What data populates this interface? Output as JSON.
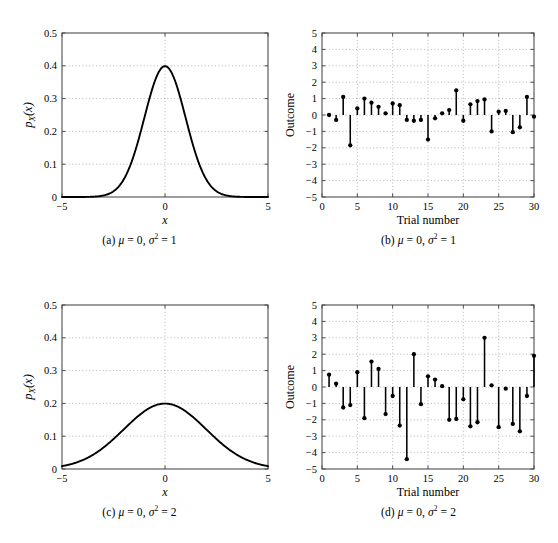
{
  "figure": {
    "background_color": "#ffffff",
    "axis_color": "#4d4d4d",
    "curve_color": "#000000",
    "grid_color": "#9a9a9a"
  },
  "panels": [
    {
      "id": "a",
      "caption_prefix": "(a)",
      "caption_mu": "μ",
      "caption_mu_value": "0",
      "caption_sigma": "σ",
      "caption_sigma_exp": "2",
      "caption_sigma_value": "1",
      "xlabel": "x",
      "ylabel": "p_X(x)",
      "ylabel_parts": {
        "p": "p",
        "sub": "X",
        "arg": "(x)"
      },
      "xticks": [
        "−5",
        "0",
        "5"
      ],
      "yticks": [
        "0",
        "0.1",
        "0.2",
        "0.3",
        "0.4",
        "0.5"
      ]
    },
    {
      "id": "b",
      "caption_prefix": "(b)",
      "caption_mu": "μ",
      "caption_mu_value": "0",
      "caption_sigma": "σ",
      "caption_sigma_exp": "2",
      "caption_sigma_value": "1",
      "xlabel": "Trial number",
      "ylabel": "Outcome",
      "xticks": [
        "0",
        "5",
        "10",
        "15",
        "20",
        "25",
        "30"
      ],
      "yticks": [
        "−5",
        "−4",
        "−3",
        "−2",
        "−1",
        "0",
        "1",
        "2",
        "3",
        "4",
        "5"
      ]
    },
    {
      "id": "c",
      "caption_prefix": "(c)",
      "caption_mu": "μ",
      "caption_mu_value": "0",
      "caption_sigma": "σ",
      "caption_sigma_exp": "2",
      "caption_sigma_value": "2",
      "xlabel": "x",
      "ylabel": "p_X(x)",
      "ylabel_parts": {
        "p": "p",
        "sub": "X",
        "arg": "(x)"
      },
      "xticks": [
        "−5",
        "0",
        "5"
      ],
      "yticks": [
        "0",
        "0.1",
        "0.2",
        "0.3",
        "0.4",
        "0.5"
      ]
    },
    {
      "id": "d",
      "caption_prefix": "(d)",
      "caption_mu": "μ",
      "caption_mu_value": "0",
      "caption_sigma": "σ",
      "caption_sigma_exp": "2",
      "caption_sigma_value": "2",
      "xlabel": "Trial number",
      "ylabel": "Outcome",
      "xticks": [
        "0",
        "5",
        "10",
        "15",
        "20",
        "25",
        "30"
      ],
      "yticks": [
        "−5",
        "−4",
        "−3",
        "−2",
        "−1",
        "0",
        "1",
        "2",
        "3",
        "4",
        "5"
      ]
    }
  ],
  "chart_data": [
    {
      "type": "line",
      "panel": "a",
      "title": "(a) μ = 0, σ² = 1",
      "xlabel": "x",
      "ylabel": "p_X(x)",
      "xlim": [
        -5,
        5
      ],
      "ylim": [
        0,
        0.5
      ],
      "xticks": [
        -5,
        0,
        5
      ],
      "yticks": [
        0,
        0.1,
        0.2,
        0.3,
        0.4,
        0.5
      ],
      "grid": true,
      "legend": null,
      "distribution": {
        "name": "gaussian_pdf",
        "mu": 0,
        "sigma2": 1,
        "peak": 0.3989
      },
      "x": [
        -5,
        -4.5,
        -4,
        -3.5,
        -3,
        -2.5,
        -2,
        -1.5,
        -1,
        -0.5,
        0,
        0.5,
        1,
        1.5,
        2,
        2.5,
        3,
        3.5,
        4,
        4.5,
        5
      ],
      "values": [
        1.5e-06,
        1.6e-05,
        0.0001338,
        0.0008727,
        0.0044318,
        0.0175283,
        0.053991,
        0.1295176,
        0.2419707,
        0.3520653,
        0.3989423,
        0.3520653,
        0.2419707,
        0.1295176,
        0.053991,
        0.0175283,
        0.0044318,
        0.0008727,
        0.0001338,
        1.6e-05,
        1.5e-06
      ]
    },
    {
      "type": "scatter",
      "subtype": "stem",
      "panel": "b",
      "title": "(b) μ = 0, σ² = 1",
      "xlabel": "Trial number",
      "ylabel": "Outcome",
      "xlim": [
        0,
        30
      ],
      "ylim": [
        -5,
        5
      ],
      "xticks": [
        0,
        5,
        10,
        15,
        20,
        25,
        30
      ],
      "yticks": [
        -5,
        -4,
        -3,
        -2,
        -1,
        0,
        1,
        2,
        3,
        4,
        5
      ],
      "grid": true,
      "legend": null,
      "categories": [
        1,
        2,
        3,
        4,
        5,
        6,
        7,
        8,
        9,
        10,
        11,
        12,
        13,
        14,
        15,
        16,
        17,
        18,
        19,
        20,
        21,
        22,
        23,
        24,
        25,
        26,
        27,
        28,
        29,
        30
      ],
      "values": [
        0.0,
        -0.3,
        1.1,
        -1.85,
        0.4,
        1.0,
        0.75,
        0.5,
        0.1,
        0.7,
        0.6,
        -0.3,
        -0.35,
        -0.3,
        -1.5,
        -0.2,
        0.1,
        0.3,
        1.5,
        -0.35,
        0.65,
        0.85,
        0.95,
        -1.0,
        0.2,
        0.25,
        -1.05,
        -0.75,
        1.1,
        -0.1
      ]
    },
    {
      "type": "line",
      "panel": "c",
      "title": "(c) μ = 0, σ² = 2",
      "xlabel": "x",
      "ylabel": "p_X(x)",
      "xlim": [
        -5,
        5
      ],
      "ylim": [
        0,
        0.5
      ],
      "xticks": [
        -5,
        0,
        5
      ],
      "yticks": [
        0,
        0.1,
        0.2,
        0.3,
        0.4,
        0.5
      ],
      "grid": true,
      "legend": null,
      "distribution": {
        "name": "gaussian_pdf",
        "mu": 0,
        "sigma2": 4,
        "peak": 0.1995
      },
      "x": [
        -5,
        -4.5,
        -4,
        -3.5,
        -3,
        -2.5,
        -2,
        -1.5,
        -1,
        -0.5,
        0,
        0.5,
        1,
        1.5,
        2,
        2.5,
        3,
        3.5,
        4,
        4.5,
        5
      ],
      "values": [
        0.0087,
        0.0158,
        0.027,
        0.0432,
        0.0648,
        0.0912,
        0.121,
        0.1506,
        0.176,
        0.1933,
        0.1995,
        0.1933,
        0.176,
        0.1506,
        0.121,
        0.0912,
        0.0648,
        0.0432,
        0.027,
        0.0158,
        0.0087
      ]
    },
    {
      "type": "scatter",
      "subtype": "stem",
      "panel": "d",
      "title": "(d) μ = 0, σ² = 2",
      "xlabel": "Trial number",
      "ylabel": "Outcome",
      "xlim": [
        0,
        30
      ],
      "ylim": [
        -5,
        5
      ],
      "xticks": [
        0,
        5,
        10,
        15,
        20,
        25,
        30
      ],
      "yticks": [
        -5,
        -4,
        -3,
        -2,
        -1,
        0,
        1,
        2,
        3,
        4,
        5
      ],
      "grid": true,
      "legend": null,
      "categories": [
        1,
        2,
        3,
        4,
        5,
        6,
        7,
        8,
        9,
        10,
        11,
        12,
        13,
        14,
        15,
        16,
        17,
        18,
        19,
        20,
        21,
        22,
        23,
        24,
        25,
        26,
        27,
        28,
        29,
        30
      ],
      "values": [
        0.75,
        0.2,
        -1.25,
        -1.1,
        0.9,
        -1.9,
        1.55,
        1.1,
        -1.65,
        -0.55,
        -2.35,
        -4.4,
        2.0,
        -1.05,
        0.65,
        0.45,
        0.05,
        -2.0,
        -1.95,
        -0.75,
        -2.4,
        -2.15,
        3.0,
        0.1,
        -2.45,
        -0.1,
        -2.25,
        -2.7,
        -0.55,
        1.9
      ]
    }
  ]
}
